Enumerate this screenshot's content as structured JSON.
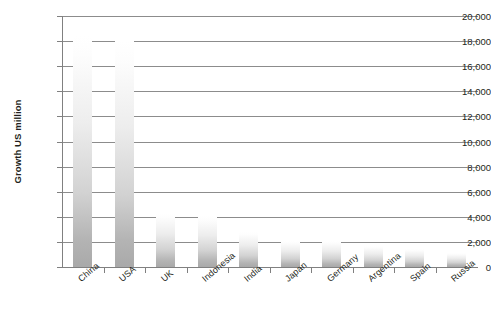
{
  "chart_data": {
    "type": "bar",
    "title": "",
    "subtitle": "",
    "xlabel": "",
    "ylabel": "Growth US million",
    "ylim": [
      0,
      20000
    ],
    "ytick_step": 2000,
    "yticks": [
      "20,000",
      "18,000",
      "16,000",
      "14,000",
      "12,000",
      "10,000",
      "8,000",
      "6,000",
      "4,000",
      "2,000",
      "0"
    ],
    "ytick_values": [
      20000,
      18000,
      16000,
      14000,
      12000,
      10000,
      8000,
      6000,
      4000,
      2000,
      0
    ],
    "grid": true,
    "legend": "none",
    "categories": [
      "China",
      "USA",
      "UK",
      "Indonesia",
      "India",
      "Japan",
      "Germany",
      "Argentina",
      "Spain",
      "Russia"
    ],
    "values": [
      18400,
      18000,
      4300,
      4100,
      2800,
      2100,
      2050,
      1700,
      1400,
      1100
    ],
    "bar_gradient": {
      "top": "#ffffff",
      "bottom": "#a9a9a9"
    },
    "axis_color": "#808080",
    "gridline_color": "#8c8c8c",
    "text_color": "#231f20",
    "background": "#ffffff"
  }
}
